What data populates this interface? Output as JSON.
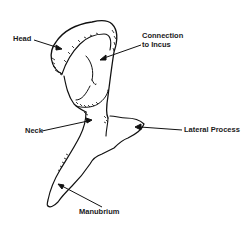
{
  "diagram": {
    "stroke_color": "#111111",
    "background": "#ffffff",
    "labels": {
      "head": "Head",
      "connection_line1": "Connection",
      "connection_line2": "to Incus",
      "neck": "Neck",
      "lateral_process": "Lateral Process",
      "manubrium": "Manubrium"
    }
  }
}
